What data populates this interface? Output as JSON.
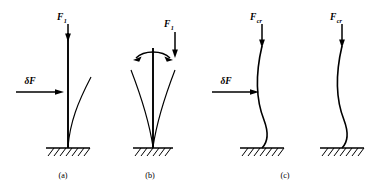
{
  "figure": {
    "background_color": "#ffffff",
    "ink_color": "#000000",
    "width": 388,
    "height": 189
  },
  "labels": {
    "force_symbol": "F",
    "subscript_one": "1",
    "subscript_critical": "cr",
    "delta_force": "δF"
  },
  "panels": [
    {
      "id": "panel-a",
      "caption": "(a)",
      "caption_x": 63,
      "caption_y": 178,
      "axis_x": 68,
      "base_y": 148,
      "top_y": 33,
      "force_label_x": 62,
      "force_label_y": 20,
      "force_sub": "1",
      "delta_label": "δF",
      "delta_label_x": 14,
      "delta_label_y": 84,
      "delta_arrow_y": 92,
      "delta_arrow_x1": 16,
      "delta_arrow_x2": 64,
      "has_delta": true,
      "deflection_count": 1,
      "state": "stable-straight-with-single-deflection"
    },
    {
      "id": "panel-b",
      "caption": "(b)",
      "caption_x": 150,
      "caption_y": 178,
      "axis_x": 153,
      "base_y": 148,
      "top_y": 48,
      "force_label_x": 168,
      "force_label_y": 26,
      "force_sub": "1",
      "has_delta": false,
      "deflection_count": 2,
      "state": "neutral-with-symmetric-deflections-and-rocking-arrow"
    },
    {
      "id": "panel-c",
      "caption": "(c)",
      "caption_x": 285,
      "caption_y": 178,
      "axis_x": 262,
      "base_y": 148,
      "top_y": 38,
      "force_label_x": 256,
      "force_label_y": 20,
      "force_sub": "cr",
      "delta_label": "δF",
      "delta_label_x": 210,
      "delta_label_y": 84,
      "delta_arrow_y": 92,
      "delta_arrow_x1": 212,
      "delta_arrow_x2": 262,
      "has_delta": true,
      "deflection_count": 0,
      "state": "buckled-under-critical-load-with-perturbation"
    },
    {
      "id": "panel-d",
      "caption": "",
      "axis_x": 342,
      "base_y": 148,
      "top_y": 38,
      "force_label_x": 336,
      "force_label_y": 20,
      "force_sub": "cr",
      "has_delta": false,
      "deflection_count": 0,
      "state": "buckled-under-critical-load-no-perturbation"
    }
  ],
  "supports": [
    {
      "id": "support-a",
      "center_x": 68,
      "half_width": 22,
      "y": 148
    },
    {
      "id": "support-b",
      "center_x": 153,
      "half_width": 20,
      "y": 148
    },
    {
      "id": "support-c",
      "center_x": 262,
      "half_width": 22,
      "y": 148
    },
    {
      "id": "support-d",
      "center_x": 342,
      "half_width": 22,
      "y": 148
    }
  ]
}
